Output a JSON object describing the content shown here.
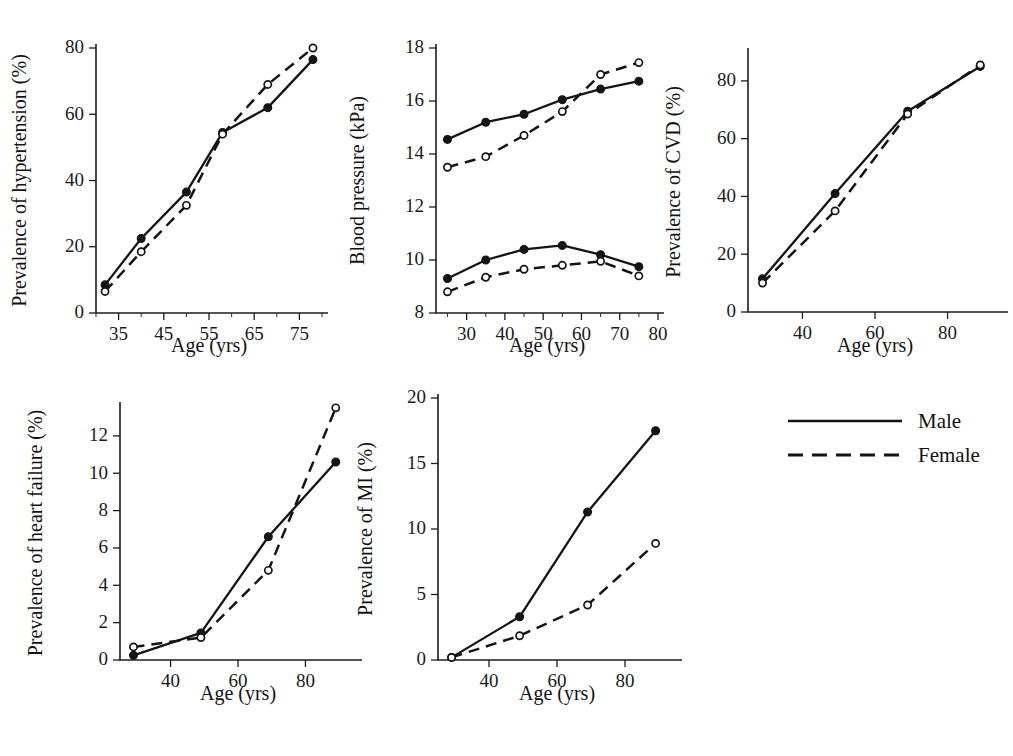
{
  "figure": {
    "legend": {
      "position": "bottom-right",
      "entries": [
        {
          "label": "Male",
          "style": "solid",
          "marker": "filled-circle"
        },
        {
          "label": "Female",
          "style": "dashed",
          "marker": "open-circle"
        }
      ]
    }
  },
  "chart_data": [
    {
      "id": "hypertension",
      "type": "line",
      "title": "",
      "xlabel": "Age (yrs)",
      "ylabel": "Prevalence of hypertension (%)",
      "xlim": [
        30,
        80
      ],
      "ylim": [
        0,
        80
      ],
      "xticks": [
        35,
        45,
        55,
        65,
        75
      ],
      "xtick_labels": [
        "35",
        "45",
        "55",
        "65",
        "75"
      ],
      "yticks": [
        0,
        20,
        40,
        60,
        80
      ],
      "ytick_labels": [
        "0",
        "20",
        "40",
        "60",
        "80"
      ],
      "x": [
        32,
        40,
        50,
        58,
        68,
        78
      ],
      "series": [
        {
          "name": "Male",
          "values": [
            8.5,
            22.5,
            36.5,
            54.5,
            62.0,
            76.5
          ]
        },
        {
          "name": "Female",
          "values": [
            6.5,
            18.5,
            32.5,
            54.0,
            69.0,
            80.0
          ]
        }
      ]
    },
    {
      "id": "blood-pressure",
      "type": "line",
      "title": "",
      "xlabel": "Age (yrs)",
      "ylabel": "Blood pressure (kPa)",
      "xlim": [
        22,
        80
      ],
      "ylim": [
        8,
        18
      ],
      "xticks": [
        30,
        40,
        50,
        60,
        70,
        80
      ],
      "xtick_labels": [
        "30",
        "40",
        "50",
        "60",
        "70",
        "80"
      ],
      "yticks": [
        8,
        10,
        12,
        14,
        16,
        18
      ],
      "ytick_labels": [
        "8",
        "10",
        "12",
        "14",
        "16",
        "18"
      ],
      "x": [
        25,
        35,
        45,
        55,
        65,
        75
      ],
      "series": [
        {
          "name": "Male systolic",
          "values": [
            14.55,
            15.2,
            15.5,
            16.05,
            16.45,
            16.75
          ]
        },
        {
          "name": "Female systolic",
          "values": [
            13.5,
            13.9,
            14.7,
            15.6,
            17.0,
            17.45
          ]
        },
        {
          "name": "Male diastolic",
          "values": [
            9.3,
            10.0,
            10.4,
            10.55,
            10.2,
            9.75
          ]
        },
        {
          "name": "Female diastolic",
          "values": [
            8.8,
            9.35,
            9.65,
            9.8,
            9.95,
            9.4
          ]
        }
      ]
    },
    {
      "id": "cvd",
      "type": "line",
      "title": "",
      "xlabel": "Age (yrs)",
      "ylabel": "Prevalence of CVD (%)",
      "xlim": [
        25,
        95
      ],
      "ylim": [
        0,
        90
      ],
      "xticks": [
        40,
        60,
        80
      ],
      "xtick_labels": [
        "40",
        "60",
        "80"
      ],
      "yticks": [
        0,
        20,
        40,
        60,
        80
      ],
      "ytick_labels": [
        "0",
        "20",
        "40",
        "60",
        "80"
      ],
      "x": [
        29,
        49,
        69,
        89
      ],
      "series": [
        {
          "name": "Male",
          "values": [
            11.5,
            41.0,
            69.5,
            85.0
          ]
        },
        {
          "name": "Female",
          "values": [
            10.0,
            35.0,
            68.5,
            85.5
          ]
        }
      ]
    },
    {
      "id": "heart-failure",
      "type": "line",
      "title": "",
      "xlabel": "Age (yrs)",
      "ylabel": "Prevalence of heart failure (%)",
      "xlim": [
        25,
        95
      ],
      "ylim": [
        0,
        13.6
      ],
      "xticks": [
        40,
        60,
        80
      ],
      "xtick_labels": [
        "40",
        "60",
        "80"
      ],
      "yticks": [
        0,
        2,
        4,
        6,
        8,
        10,
        12
      ],
      "ytick_labels": [
        "0",
        "2",
        "4",
        "6",
        "8",
        "10",
        "12"
      ],
      "x": [
        29,
        49,
        69,
        89
      ],
      "series": [
        {
          "name": "Male",
          "values": [
            0.25,
            1.45,
            6.6,
            10.6
          ]
        },
        {
          "name": "Female",
          "values": [
            0.7,
            1.2,
            4.8,
            13.5
          ]
        }
      ]
    },
    {
      "id": "mi",
      "type": "line",
      "title": "",
      "xlabel": "Age (yrs)",
      "ylabel": "Prevalence of MI (%)",
      "xlim": [
        25,
        95
      ],
      "ylim": [
        0,
        20
      ],
      "xticks": [
        40,
        60,
        80
      ],
      "xtick_labels": [
        "40",
        "60",
        "80"
      ],
      "yticks": [
        0,
        5,
        10,
        15,
        20
      ],
      "ytick_labels": [
        "0",
        "5",
        "10",
        "15",
        "20"
      ],
      "x": [
        29,
        49,
        69,
        89
      ],
      "series": [
        {
          "name": "Male",
          "values": [
            0.2,
            3.3,
            11.3,
            17.5
          ]
        },
        {
          "name": "Female",
          "values": [
            0.2,
            1.85,
            4.2,
            8.9
          ]
        }
      ]
    }
  ]
}
